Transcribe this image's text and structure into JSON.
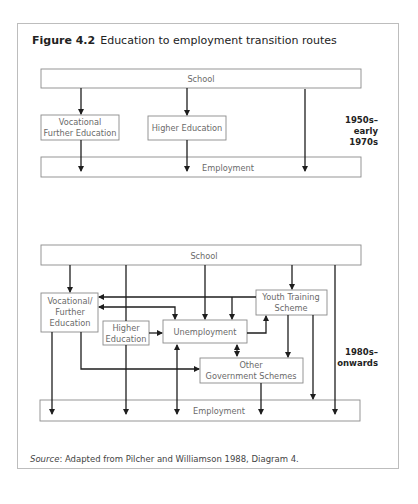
{
  "figure": {
    "number": "Figure 4.2",
    "title": "Education to employment transition routes"
  },
  "diagram_1950s": {
    "era_label": "1950s–\nearly 1970s",
    "nodes": {
      "school": "School",
      "vocational_further_education_line1": "Vocational",
      "vocational_further_education_line2": "Further Education",
      "higher_education": "Higher Education",
      "employment": "Employment"
    },
    "edges": [
      {
        "from": "School",
        "to": "Vocational Further Education"
      },
      {
        "from": "School",
        "to": "Higher Education"
      },
      {
        "from": "School",
        "to": "Employment"
      },
      {
        "from": "Vocational Further Education",
        "to": "Employment"
      },
      {
        "from": "Higher Education",
        "to": "Employment"
      }
    ]
  },
  "diagram_1980s": {
    "era_label": "1980s–\nonwards",
    "nodes": {
      "school": "School",
      "vocational_line1": "Vocational/",
      "vocational_line2": "Further",
      "vocational_line3": "Education",
      "higher_line1": "Higher",
      "higher_line2": "Education",
      "unemployment": "Unemployment",
      "yts_line1": "Youth Training",
      "yts_line2": "Scheme",
      "ogs_line1": "Other",
      "ogs_line2": "Government Schemes",
      "employment": "Employment"
    },
    "edges": [
      {
        "from": "School",
        "to": "Vocational/Further Education"
      },
      {
        "from": "School",
        "to": "Unemployment"
      },
      {
        "from": "School",
        "to": "Youth Training Scheme"
      },
      {
        "from": "School",
        "to": "Employment"
      },
      {
        "from": "School",
        "to": "Higher Education"
      },
      {
        "from": "Youth Training Scheme",
        "to": "Vocational/Further Education"
      },
      {
        "from": "Youth Training Scheme",
        "to": "Unemployment"
      },
      {
        "from": "Vocational/Further Education",
        "to": "Unemployment",
        "bidirectional": true
      },
      {
        "from": "Higher Education",
        "to": "Unemployment"
      },
      {
        "from": "Unemployment",
        "to": "Youth Training Scheme"
      },
      {
        "from": "Unemployment",
        "to": "Other Government Schemes",
        "bidirectional": true
      },
      {
        "from": "Unemployment",
        "to": "Employment",
        "bidirectional": true
      },
      {
        "from": "Youth Training Scheme",
        "to": "Other Government Schemes"
      },
      {
        "from": "Youth Training Scheme",
        "to": "Employment"
      },
      {
        "from": "Vocational/Further Education",
        "to": "Other Government Schemes"
      },
      {
        "from": "Vocational/Further Education",
        "to": "Employment"
      },
      {
        "from": "Higher Education",
        "to": "Employment"
      },
      {
        "from": "Other Government Schemes",
        "to": "Employment"
      }
    ]
  },
  "source": {
    "label": "Source",
    "text": ": Adapted from Pilcher and Williamson 1988, Diagram 4."
  }
}
